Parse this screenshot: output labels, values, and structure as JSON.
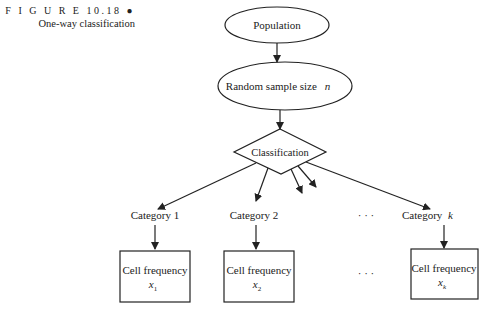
{
  "caption": {
    "figure_label": "F I G U R E  10.18 ●",
    "title": "One-way classification"
  },
  "nodes": {
    "population": "Population",
    "sample": "Random sample size",
    "sample_var": "n",
    "classification": "Classification",
    "categories": [
      {
        "label": "Category 1",
        "cell": "Cell frequency",
        "var": "x",
        "sub": "1"
      },
      {
        "label": "Category 2",
        "cell": "Cell frequency",
        "var": "x",
        "sub": "2"
      },
      {
        "label": "Category",
        "label_var": "k",
        "cell": "Cell frequency",
        "var": "x",
        "sub": "k"
      }
    ],
    "ellipsis": "· · ·"
  }
}
